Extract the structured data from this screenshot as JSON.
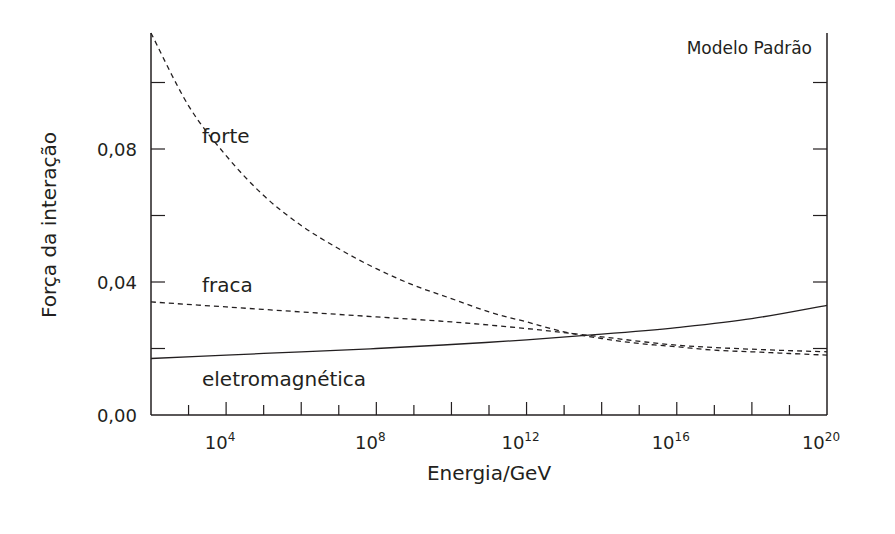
{
  "chart_data": {
    "type": "line",
    "title": "Modelo Padrão",
    "xlabel": "Energia/GeV",
    "ylabel": "Força da interação",
    "x_scale": "log",
    "x_exponent_range": [
      2,
      20
    ],
    "ylim": [
      0.0,
      0.115
    ],
    "x_ticks": [
      {
        "base": "10",
        "exp": "4",
        "value": 4
      },
      {
        "base": "10",
        "exp": "8",
        "value": 8
      },
      {
        "base": "10",
        "exp": "12",
        "value": 12
      },
      {
        "base": "10",
        "exp": "16",
        "value": 16
      },
      {
        "base": "10",
        "exp": "20",
        "value": 20
      }
    ],
    "y_ticks": [
      {
        "label": "0,00",
        "value": 0.0
      },
      {
        "label": "0,04",
        "value": 0.04
      },
      {
        "label": "0,08",
        "value": 0.08
      }
    ],
    "y_minor_ticks": [
      0.02,
      0.06,
      0.1
    ],
    "grid": false,
    "legend": "inline labels",
    "series": [
      {
        "name": "forte",
        "style": "dashed",
        "x_log10": [
          2,
          3,
          4,
          5,
          6,
          7,
          8,
          9,
          10,
          11,
          12,
          13,
          14,
          15,
          16,
          17,
          18,
          19,
          20
        ],
        "values": [
          0.115,
          0.093,
          0.078,
          0.066,
          0.057,
          0.05,
          0.044,
          0.039,
          0.035,
          0.031,
          0.028,
          0.025,
          0.023,
          0.0215,
          0.0205,
          0.0195,
          0.019,
          0.0185,
          0.018
        ]
      },
      {
        "name": "fraca",
        "style": "dashed",
        "x_log10": [
          2,
          4,
          6,
          8,
          10,
          12,
          14,
          16,
          18,
          20
        ],
        "values": [
          0.034,
          0.0325,
          0.031,
          0.0295,
          0.028,
          0.026,
          0.0235,
          0.021,
          0.0198,
          0.019
        ]
      },
      {
        "name": "eletromagnética",
        "style": "solid",
        "x_log10": [
          2,
          4,
          6,
          8,
          10,
          12,
          14,
          16,
          18,
          20
        ],
        "values": [
          0.017,
          0.018,
          0.019,
          0.02,
          0.0212,
          0.0226,
          0.0243,
          0.0263,
          0.029,
          0.033
        ]
      }
    ]
  }
}
